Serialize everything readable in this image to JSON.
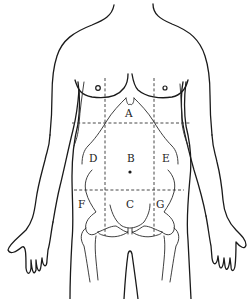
{
  "diagram": {
    "type": "anatomical-abdominal-regions",
    "regions": [
      {
        "id": "A",
        "label": "A",
        "x": 129,
        "y": 114
      },
      {
        "id": "B",
        "label": "B",
        "x": 131,
        "y": 159
      },
      {
        "id": "C",
        "label": "C",
        "x": 130,
        "y": 205
      },
      {
        "id": "D",
        "label": "D",
        "x": 94,
        "y": 159
      },
      {
        "id": "E",
        "label": "E",
        "x": 166,
        "y": 159
      },
      {
        "id": "F",
        "label": "F",
        "x": 82,
        "y": 205
      },
      {
        "id": "G",
        "label": "G",
        "x": 178,
        "y": 205
      }
    ],
    "umbilicus_marker": {
      "x": 130,
      "y": 172
    },
    "grid_lines": {
      "vertical": [
        {
          "x": 105,
          "y1": 78,
          "y2": 236
        },
        {
          "x": 154,
          "y1": 78,
          "y2": 236
        }
      ],
      "horizontal": [
        {
          "y": 123,
          "x1": 72,
          "x2": 190
        },
        {
          "y": 190,
          "x1": 74,
          "x2": 184
        }
      ]
    },
    "colors": {
      "line": "#1a1a1a",
      "background": "#ffffff"
    }
  }
}
